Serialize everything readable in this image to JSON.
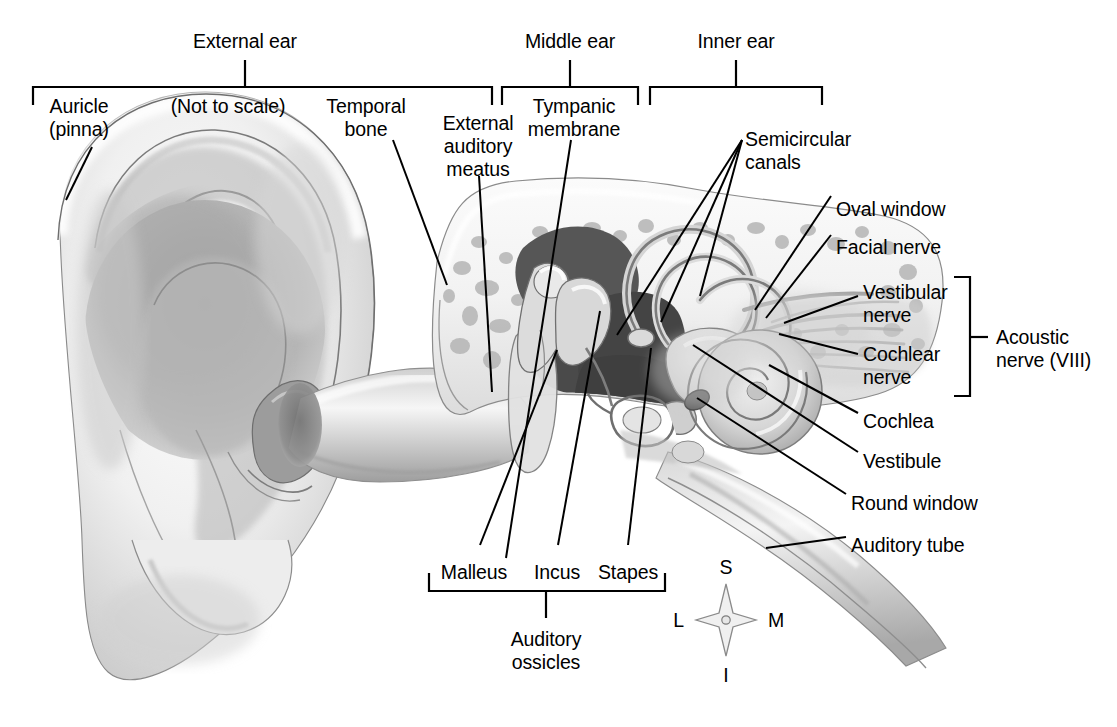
{
  "figure": {
    "type": "anatomical-illustration",
    "note": "(Not to scale)",
    "line_color": "#000000",
    "background_color": "#ffffff"
  },
  "region_brackets": [
    {
      "id": "external-ear",
      "label": "External ear",
      "x1": 33,
      "x2": 492,
      "stem_x": 245,
      "bracket_y": 87,
      "label_y": 30
    },
    {
      "id": "middle-ear",
      "label": "Middle ear",
      "x1": 502,
      "x2": 638,
      "stem_x": 570,
      "bracket_y": 87,
      "label_y": 30
    },
    {
      "id": "inner-ear",
      "label": "Inner ear",
      "x1": 650,
      "x2": 822,
      "stem_x": 736,
      "bracket_y": 87,
      "label_y": 30
    }
  ],
  "ossicles_bracket": {
    "id": "auditory-ossicles",
    "label": "Auditory\nossicles",
    "line1": "Auditory",
    "line2": "ossicles",
    "x1": 429,
    "x2": 665,
    "stem_x": 546,
    "bracket_y": 591,
    "label_y": 628
  },
  "acoustic_nerve_bracket": {
    "id": "acoustic-nerve",
    "label": "Acoustic\nnerve (VIII)",
    "line1": "Acoustic",
    "line2": "nerve (VIII)",
    "x": 970,
    "y1": 277,
    "y2": 396,
    "stem_y": 337,
    "label_x": 996,
    "label_y": 326
  },
  "note_label": {
    "text": "(Not to scale)",
    "x": 228,
    "y": 95
  },
  "labels": [
    {
      "id": "auricle-pinna",
      "line1": "Auricle",
      "line2": "(pinna)",
      "x": 79,
      "y": 95,
      "align": "center"
    },
    {
      "id": "temporal-bone",
      "line1": "Temporal",
      "line2": "bone",
      "x": 366,
      "y": 95,
      "align": "center"
    },
    {
      "id": "external-auditory-meatus",
      "line1": "External",
      "line2": "auditory",
      "line3": "meatus",
      "x": 478,
      "y": 112,
      "align": "center"
    },
    {
      "id": "tympanic-membrane",
      "line1": "Tympanic",
      "line2": "membrane",
      "x": 574,
      "y": 95,
      "align": "center"
    },
    {
      "id": "semicircular-canals",
      "line1": "Semicircular",
      "line2": "canals",
      "x": 745,
      "y": 128,
      "align": "left"
    },
    {
      "id": "oval-window",
      "line1": "Oval window",
      "x": 836,
      "y": 198,
      "align": "left"
    },
    {
      "id": "facial-nerve",
      "line1": "Facial nerve",
      "x": 836,
      "y": 236,
      "align": "left"
    },
    {
      "id": "vestibular-nerve",
      "line1": "Vestibular",
      "line2": "nerve",
      "x": 863,
      "y": 281,
      "align": "left"
    },
    {
      "id": "cochlear-nerve",
      "line1": "Cochlear",
      "line2": "nerve",
      "x": 863,
      "y": 343,
      "align": "left"
    },
    {
      "id": "cochlea",
      "line1": "Cochlea",
      "x": 863,
      "y": 410,
      "align": "left"
    },
    {
      "id": "vestibule",
      "line1": "Vestibule",
      "x": 863,
      "y": 450,
      "align": "left"
    },
    {
      "id": "round-window",
      "line1": "Round window",
      "x": 851,
      "y": 492,
      "align": "left"
    },
    {
      "id": "auditory-tube",
      "line1": "Auditory tube",
      "x": 851,
      "y": 534,
      "align": "left"
    },
    {
      "id": "malleus",
      "line1": "Malleus",
      "x": 474,
      "y": 561,
      "align": "center"
    },
    {
      "id": "incus",
      "line1": "Incus",
      "x": 557,
      "y": 561,
      "align": "center"
    },
    {
      "id": "stapes",
      "line1": "Stapes",
      "x": 628,
      "y": 561,
      "align": "center"
    }
  ],
  "leader_lines": [
    {
      "id": "auricle-pinna",
      "x1": 92,
      "y1": 147,
      "x2": 66,
      "y2": 200
    },
    {
      "id": "temporal-bone",
      "x1": 393,
      "y1": 140,
      "x2": 447,
      "y2": 285
    },
    {
      "id": "external-auditory-meatus",
      "x1": 479,
      "y1": 176,
      "x2": 492,
      "y2": 392
    },
    {
      "id": "tympanic-membrane",
      "x1": 571,
      "y1": 140,
      "x2": 506,
      "y2": 558
    },
    {
      "id": "semicircular-canals-a",
      "x1": 742,
      "y1": 140,
      "x2": 617,
      "y2": 335
    },
    {
      "id": "semicircular-canals-b",
      "x1": 742,
      "y1": 140,
      "x2": 661,
      "y2": 322
    },
    {
      "id": "semicircular-canals-c",
      "x1": 742,
      "y1": 140,
      "x2": 700,
      "y2": 296
    },
    {
      "id": "oval-window",
      "x1": 831,
      "y1": 196,
      "x2": 755,
      "y2": 310
    },
    {
      "id": "facial-nerve",
      "x1": 831,
      "y1": 235,
      "x2": 766,
      "y2": 318
    },
    {
      "id": "vestibular-nerve",
      "x1": 858,
      "y1": 296,
      "x2": 784,
      "y2": 323
    },
    {
      "id": "cochlear-nerve",
      "x1": 858,
      "y1": 354,
      "x2": 779,
      "y2": 334
    },
    {
      "id": "cochlea",
      "x1": 858,
      "y1": 413,
      "x2": 769,
      "y2": 365
    },
    {
      "id": "vestibule",
      "x1": 858,
      "y1": 452,
      "x2": 693,
      "y2": 345
    },
    {
      "id": "round-window",
      "x1": 846,
      "y1": 494,
      "x2": 697,
      "y2": 398
    },
    {
      "id": "auditory-tube",
      "x1": 846,
      "y1": 537,
      "x2": 766,
      "y2": 548
    },
    {
      "id": "malleus",
      "x1": 480,
      "y1": 545,
      "x2": 557,
      "y2": 350
    },
    {
      "id": "incus",
      "x1": 558,
      "y1": 545,
      "x2": 600,
      "y2": 311
    },
    {
      "id": "stapes",
      "x1": 628,
      "y1": 545,
      "x2": 651,
      "y2": 348
    }
  ],
  "orientation_compass": {
    "id": "orientation-compass",
    "center_x": 726,
    "center_y": 620,
    "superior": "S",
    "inferior": "I",
    "lateral": "L",
    "medial": "M"
  }
}
